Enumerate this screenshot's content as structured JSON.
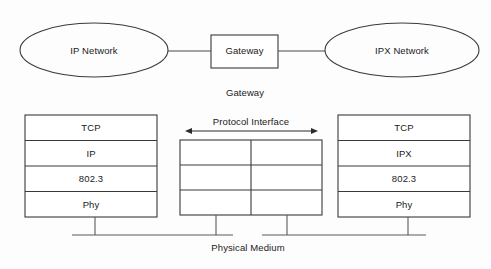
{
  "diagram": {
    "colors": {
      "background": "#fdfdfd",
      "stroke": "#3a3a3a",
      "line": "#5a5a5a",
      "text": "#1a1a1a"
    },
    "top_row": {
      "left_network": "IP Network",
      "gateway_box": "Gateway",
      "right_network": "IPX Network"
    },
    "gateway_caption": "Gateway",
    "protocol_interface_label": "Protocol Interface",
    "physical_medium_label": "Physical Medium",
    "left_stack": {
      "layers": [
        "TCP",
        "IP",
        "802.3",
        "Phy"
      ]
    },
    "middle_stack": {
      "layers": [
        "",
        "",
        ""
      ],
      "columns": 2
    },
    "right_stack": {
      "layers": [
        "TCP",
        "IPX",
        "802.3",
        "Phy"
      ]
    }
  }
}
